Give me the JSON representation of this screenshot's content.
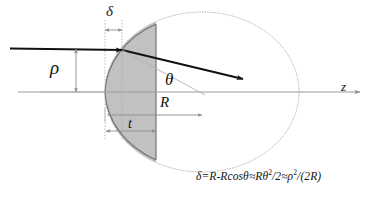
{
  "figure": {
    "labels": {
      "delta": "δ",
      "rho": "ρ",
      "theta": "θ",
      "radius": "R",
      "thickness": "t",
      "axis": "z"
    },
    "formula": {
      "full": "δ=R-Rcosθ ≈Rθ 2/2 ≈ρ 2/(2R)",
      "part1": "δ=R-Rcosθ",
      "part2": "≈Rθ",
      "exp2": "2",
      "part3": "/2",
      "part4": "≈ρ",
      "exp4": "2",
      "part5": "/(2R)"
    },
    "colors": {
      "stroke_dark": "#111111",
      "stroke_gray": "#8c8c8c",
      "stroke_light": "#b3b3b3",
      "shade_fill": "#c0c0c0",
      "background": "#ffffff"
    },
    "geometry": {
      "sphere_center_x": 202,
      "sphere_center_y": 92,
      "sphere_radius_x": 97,
      "sphere_radius_y": 80,
      "aperture_plane_x": 156,
      "vertex_x": 105,
      "impact_point_x": 122,
      "impact_point_y": 50
    }
  }
}
